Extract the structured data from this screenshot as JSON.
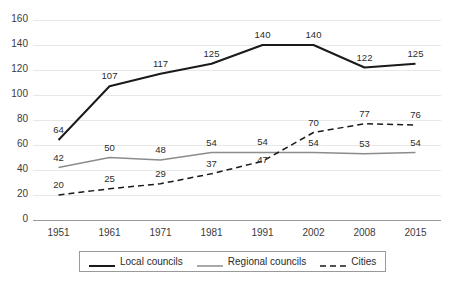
{
  "chart_data": {
    "type": "line",
    "title": "",
    "subtitle": "",
    "xlabel": "",
    "ylabel": "",
    "categories": [
      "1951",
      "1961",
      "1971",
      "1981",
      "1991",
      "2002",
      "2008",
      "2015"
    ],
    "ylim": [
      0,
      160
    ],
    "ytick_step": 20,
    "yticks": [
      "0",
      "20",
      "40",
      "60",
      "80",
      "100",
      "120",
      "140",
      "160"
    ],
    "grid": "horizontal",
    "legend_position": "bottom",
    "series": [
      {
        "name": "Local councils",
        "values": [
          64,
          107,
          117,
          125,
          140,
          140,
          122,
          125
        ],
        "labels": [
          "64",
          "107",
          "117",
          "125",
          "140",
          "140",
          "122",
          "125"
        ],
        "color": "#1a1a1a",
        "style": "solid",
        "width": 2
      },
      {
        "name": "Regional councils",
        "values": [
          42,
          50,
          48,
          54,
          54,
          54,
          53,
          54
        ],
        "labels": [
          "42",
          "50",
          "48",
          "54",
          "54",
          "54",
          "53",
          "54"
        ],
        "color": "#8c8c8c",
        "style": "solid",
        "width": 1.5
      },
      {
        "name": "Cities",
        "values": [
          20,
          25,
          29,
          37,
          47,
          70,
          77,
          76
        ],
        "labels": [
          "20",
          "25",
          "29",
          "37",
          "47",
          "70",
          "77",
          "76"
        ],
        "color": "#1a1a1a",
        "style": "dashed",
        "width": 1.5
      }
    ]
  },
  "axes": {
    "y_ticks": [
      {
        "value": "160"
      },
      {
        "value": "140"
      },
      {
        "value": "120"
      },
      {
        "value": "100"
      },
      {
        "value": "80"
      },
      {
        "value": "60"
      },
      {
        "value": "40"
      },
      {
        "value": "20"
      },
      {
        "value": "0"
      }
    ],
    "x_ticks": [
      {
        "value": "1951"
      },
      {
        "value": "1961"
      },
      {
        "value": "1971"
      },
      {
        "value": "1981"
      },
      {
        "value": "1991"
      },
      {
        "value": "2002"
      },
      {
        "value": "2008"
      },
      {
        "value": "2015"
      }
    ]
  },
  "labels": {
    "local": [
      "64",
      "107",
      "117",
      "125",
      "140",
      "140",
      "122",
      "125"
    ],
    "regional": [
      "42",
      "50",
      "48",
      "54",
      "54",
      "54",
      "53",
      "54"
    ],
    "cities": [
      "20",
      "25",
      "29",
      "37",
      "47",
      "70",
      "77",
      "76"
    ]
  },
  "legend": {
    "items": [
      {
        "label": "Local councils",
        "marker": "solid-thick-line-icon"
      },
      {
        "label": "Regional councils",
        "marker": "solid-gray-line-icon"
      },
      {
        "label": "Cities",
        "marker": "dashed-line-icon"
      }
    ]
  },
  "colors": {
    "local": "#1a1a1a",
    "regional": "#8c8c8c",
    "cities": "#1a1a1a",
    "grid": "#e8e8e8",
    "axis": "#9a9a9a",
    "text": "#2b2b2b"
  }
}
